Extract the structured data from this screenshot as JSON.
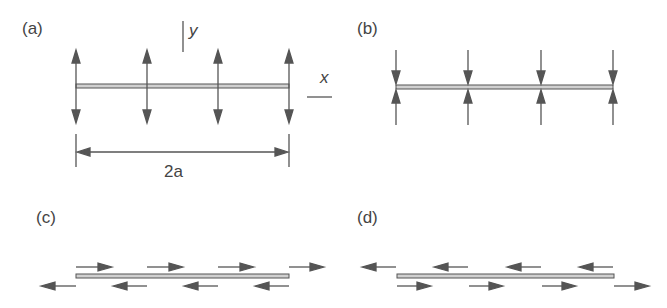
{
  "colors": {
    "stroke": "#555555",
    "beam_fill": "#d0d0d0",
    "text": "#444444",
    "background": "#ffffff"
  },
  "panels": [
    {
      "id": "a",
      "label": "(a)",
      "description": "Beam of length 2a with opposing vertical forces pulling away from the beam (tension across thickness)",
      "arrow_type": "vertical-outward"
    },
    {
      "id": "b",
      "label": "(b)",
      "description": "Beam with opposing vertical forces pressing into the beam (compression across thickness)",
      "arrow_type": "vertical-inward"
    },
    {
      "id": "c",
      "label": "(c)",
      "description": "Beam with shear forces: top arrows point right, bottom arrows point left",
      "arrow_type": "shear-top-right"
    },
    {
      "id": "d",
      "label": "(d)",
      "description": "Beam with shear forces: top arrows point left, bottom arrows point right",
      "arrow_type": "shear-top-left"
    }
  ],
  "axes": {
    "y_label": "y",
    "x_label": "x"
  },
  "dimension": {
    "label": "2a"
  },
  "arrow_positions": {
    "a_x": [
      76,
      147,
      218,
      289
    ],
    "b_x": [
      396,
      468,
      541,
      613
    ]
  }
}
